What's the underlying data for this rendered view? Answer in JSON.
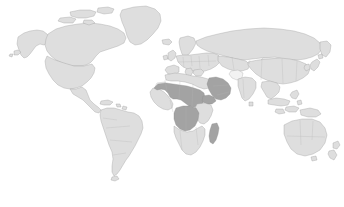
{
  "figure": {
    "type": "choropleth-world-map",
    "title": "",
    "caption": "",
    "background_color": "#ffffff",
    "width": 344,
    "height": 207
  },
  "legend": {
    "visible": false,
    "entries": [
      {
        "label": "Highlighted",
        "color": "#a3a3a3"
      },
      {
        "label": "Other countries",
        "color": "#dedede"
      },
      {
        "label": "No data",
        "color": "#f2f2f2"
      }
    ]
  },
  "colors": {
    "ocean": "#ffffff",
    "land_base": "#dedede",
    "land_highlight": "#a3a3a3",
    "land_nodata": "#f2f2f2",
    "border": "#9a9a9a"
  },
  "chart_data": {
    "type": "map",
    "projection": "equirectangular",
    "xlabel": "",
    "ylabel": "",
    "value_classes": [
      {
        "name": "highlighted",
        "color": "#a3a3a3"
      },
      {
        "name": "base",
        "color": "#dedede"
      },
      {
        "name": "no-data",
        "color": "#f2f2f2"
      }
    ],
    "highlighted_regions": [
      "Mali",
      "Niger",
      "Chad",
      "Sudan",
      "South Sudan",
      "Saudi Arabia",
      "Yemen",
      "Oman",
      "Democratic Republic of the Congo",
      "Madagascar"
    ],
    "base_regions": [
      "North America",
      "South America",
      "Europe",
      "Asia",
      "Oceania",
      "Greenland",
      "Rest of Africa"
    ],
    "nodata_regions": [
      "Western Sahara",
      "Afghanistan",
      "Mongolia"
    ],
    "continents_shown": [
      "North America",
      "South America",
      "Europe",
      "Africa",
      "Asia",
      "Oceania"
    ],
    "notable_features": [
      "Greenland",
      "Madagascar",
      "Australia",
      "New Zealand",
      "Japan",
      "Indonesia",
      "British Isles",
      "Tierra del Fuego"
    ]
  },
  "regions": {
    "north_america": "North America",
    "south_america": "South America",
    "greenland": "Greenland",
    "europe": "Europe",
    "africa": "Africa",
    "asia": "Asia",
    "oceania": "Oceania",
    "madagascar": "Madagascar",
    "japan": "Japan",
    "new_zealand": "New Zealand",
    "british_isles": "British Isles",
    "indonesia": "Indonesia",
    "sahel_belt": "Sahel belt",
    "arabian_peninsula": "Arabian Peninsula",
    "dr_congo": "Democratic Republic of the Congo"
  }
}
